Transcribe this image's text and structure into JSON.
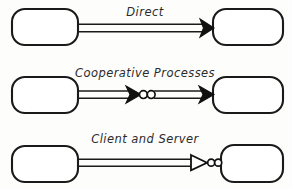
{
  "diagram": {
    "background_color": "#fdfdfc",
    "stroke_color": "#1a1a1a",
    "label_color": "#2b2b2b",
    "style": "hand-drawn sketch",
    "rows": [
      {
        "id": "direct",
        "label": "Direct",
        "label_x": 145,
        "label_y": 16,
        "left_node": {
          "x": 12,
          "y": 9,
          "width": 66,
          "height": 36,
          "radius": 13,
          "label": ""
        },
        "right_node": {
          "x": 213,
          "y": 9,
          "width": 70,
          "height": 36,
          "radius": 13,
          "label": ""
        },
        "connector": {
          "kind": "double-line-arrow",
          "shaft_y_top": 24,
          "shaft_y_bottom": 32,
          "x_start": 78,
          "x_end": 213,
          "arrowheads": [
            {
              "type": "solid",
              "x": 213,
              "y": 28
            }
          ],
          "dots": []
        }
      },
      {
        "id": "cooperative-processes",
        "label": "Cooperative Processes",
        "label_x": 145,
        "label_y": 77,
        "left_node": {
          "x": 12,
          "y": 77,
          "width": 66,
          "height": 36,
          "radius": 13,
          "label": ""
        },
        "right_node": {
          "x": 213,
          "y": 77,
          "width": 70,
          "height": 36,
          "radius": 13,
          "label": ""
        },
        "connector": {
          "kind": "double-line-arrow-with-dots",
          "shaft_y_top": 91,
          "shaft_y_bottom": 98,
          "x_start": 78,
          "x_end": 213,
          "arrowheads": [
            {
              "type": "solid",
              "x": 140,
              "y": 94.5
            },
            {
              "type": "solid",
              "x": 213,
              "y": 94.5
            }
          ],
          "dots": [
            {
              "cx": 142.5,
              "cy": 94.5,
              "r": 4.0
            },
            {
              "cx": 150.5,
              "cy": 94.5,
              "r": 4.0
            }
          ]
        }
      },
      {
        "id": "client-and-server",
        "label": "Client and Server",
        "label_x": 145,
        "label_y": 143,
        "left_node": {
          "x": 12,
          "y": 146,
          "width": 66,
          "height": 36,
          "radius": 13,
          "label": ""
        },
        "right_node": {
          "x": 221,
          "y": 145,
          "width": 62,
          "height": 37,
          "radius": 13,
          "label": ""
        },
        "connector": {
          "kind": "double-line-hollow-arrow-with-dots",
          "shaft_y_top": 159,
          "shaft_y_bottom": 166,
          "x_start": 78,
          "x_end": 200,
          "arrowheads": [
            {
              "type": "hollow",
              "x": 206,
              "y": 162.5
            }
          ],
          "dots": [
            {
              "cx": 210.5,
              "cy": 162.5,
              "r": 3.6
            },
            {
              "cx": 217.5,
              "cy": 162.5,
              "r": 3.6
            }
          ]
        }
      }
    ],
    "bottom_cropped_text": ""
  }
}
